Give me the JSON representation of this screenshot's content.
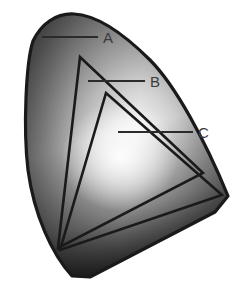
{
  "figure": {
    "background_color": "#ffffff",
    "outline_color": "#1a1a1a",
    "label_color": "#3a3a3a",
    "leader_color": "#2b2b2b"
  },
  "labels": [
    {
      "id": "A",
      "text": "A",
      "name": "label-a",
      "x": 103,
      "y": 30,
      "leader_from_x": 42,
      "leader_from_y": 37,
      "leader_to_x": 98,
      "leader_to_y": 37
    },
    {
      "id": "B",
      "text": "B",
      "name": "label-b",
      "x": 150,
      "y": 74,
      "leader_from_x": 88,
      "leader_from_y": 81,
      "leader_to_x": 145,
      "leader_to_y": 81
    },
    {
      "id": "C",
      "text": "C",
      "name": "label-c",
      "x": 198,
      "y": 125,
      "leader_from_x": 118,
      "leader_from_y": 132,
      "leader_to_x": 193,
      "leader_to_y": 132
    }
  ],
  "shapes": {
    "outer_locus": {
      "name": "spectral-locus-region",
      "label_ref": "A",
      "fill_description": "radial gradient, light center to dark grey edges",
      "path": "M 33 41 C 41 24, 56 13, 74 14 C 95 15, 120 30, 150 60 C 175 85, 205 140, 228 196 L 215 212 L 90 277 L 72 276 C 52 254, 34 215, 28 170 C 23 128, 26 62, 33 41 Z"
    },
    "triangle_b": {
      "name": "gamut-triangle-b",
      "label_ref": "B",
      "vertices": [
        [
          80,
          57
        ],
        [
          203,
          173
        ],
        [
          58,
          248
        ]
      ]
    },
    "triangle_c": {
      "name": "gamut-triangle-c",
      "label_ref": "C",
      "vertices": [
        [
          106,
          93
        ],
        [
          222,
          195
        ],
        [
          60,
          250
        ]
      ]
    }
  },
  "gradient": {
    "type": "radial",
    "highlight_center_x": 120,
    "highlight_center_y": 152,
    "highlight_color": "#ffffff",
    "mid_color": "#b6b6b6",
    "edge_color": "#4a4a4a",
    "dark_color": "#2a2a2a"
  }
}
